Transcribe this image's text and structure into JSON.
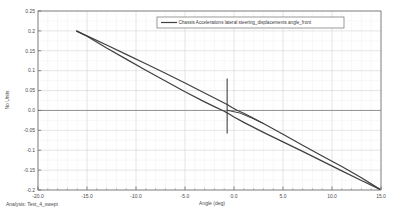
{
  "chart_data": {
    "type": "line",
    "title": "",
    "xlabel": "Angle (deg)",
    "ylabel": "No Units",
    "xlim": [
      -20.0,
      15.0
    ],
    "ylim": [
      -0.2,
      0.25
    ],
    "grid": true,
    "legend_position": "top-center",
    "xticks": [
      "-20.0",
      "-15.0",
      "-10.0",
      "-5.0",
      "0.0",
      "5.0",
      "10.0",
      "15.0"
    ],
    "xtick_values": [
      -20.0,
      -15.0,
      -10.0,
      -5.0,
      0.0,
      5.0,
      10.0,
      15.0
    ],
    "yticks": [
      "0.25",
      "0.2",
      "0.15",
      "0.1",
      "0.05",
      "0.0",
      "-0.05",
      "-0.1",
      "-0.15",
      "-0.2"
    ],
    "ytick_values": [
      0.25,
      0.2,
      0.15,
      0.1,
      0.05,
      0.0,
      -0.05,
      -0.1,
      -0.15,
      -0.2
    ],
    "series": [
      {
        "name": "Chassis Accelerations lateral steering_displacements angle_front",
        "color": "#404040",
        "upper_branch": [
          [
            -16.1,
            0.2
          ],
          [
            -15.0,
            0.1875
          ],
          [
            -13.0,
            0.1645
          ],
          [
            -11.0,
            0.141
          ],
          [
            -9.0,
            0.1175
          ],
          [
            -7.0,
            0.0935
          ],
          [
            -5.0,
            0.069
          ],
          [
            -3.0,
            0.044
          ],
          [
            -1.5,
            0.025
          ],
          [
            -0.7,
            0.015
          ],
          [
            -0.2,
            0.0075
          ],
          [
            0.3,
            0.0005
          ],
          [
            1.0,
            -0.007
          ],
          [
            2.0,
            -0.0195
          ],
          [
            3.0,
            -0.033
          ],
          [
            5.0,
            -0.06
          ],
          [
            7.0,
            -0.0875
          ],
          [
            9.0,
            -0.1145
          ],
          [
            11.0,
            -0.141
          ],
          [
            13.0,
            -0.169
          ],
          [
            14.9,
            -0.1985
          ]
        ],
        "lower_branch": [
          [
            14.9,
            -0.1985
          ],
          [
            13.0,
            -0.176
          ],
          [
            11.0,
            -0.152
          ],
          [
            9.0,
            -0.1275
          ],
          [
            7.0,
            -0.103
          ],
          [
            5.0,
            -0.079
          ],
          [
            3.0,
            -0.055
          ],
          [
            1.0,
            -0.03
          ],
          [
            0.0,
            -0.0165
          ],
          [
            -0.5,
            -0.009
          ],
          [
            -0.7,
            -0.006
          ],
          [
            -1.0,
            -0.002
          ],
          [
            -2.0,
            0.0095
          ],
          [
            -3.0,
            0.0215
          ],
          [
            -5.0,
            0.047
          ],
          [
            -7.0,
            0.074
          ],
          [
            -9.0,
            0.101
          ],
          [
            -11.0,
            0.129
          ],
          [
            -13.0,
            0.157
          ],
          [
            -15.0,
            0.1865
          ],
          [
            -16.1,
            0.2
          ]
        ],
        "inner_segment": [
          [
            -0.7,
            0.0005
          ],
          [
            0.6,
            -0.0065
          ],
          [
            1.8,
            -0.019
          ],
          [
            3.0,
            -0.033
          ]
        ],
        "marker_line": {
          "x": -0.7,
          "y_top": 0.08,
          "y_bottom": -0.058
        }
      }
    ]
  },
  "legend": {
    "entries": [
      {
        "label": "Chassis Accelerations lateral steering_displacements angle_front",
        "color": "#404040"
      }
    ]
  },
  "footer": {
    "analysis_label": "Analysis:  Test_4_swept"
  }
}
